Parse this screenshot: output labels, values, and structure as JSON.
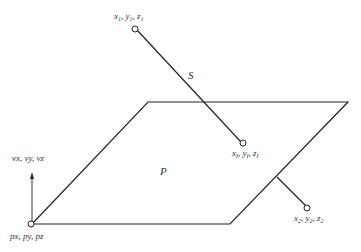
{
  "diagram": {
    "type": "ray-plane intersection geometry",
    "plane": {
      "label": "P"
    },
    "segment": {
      "label": "S"
    },
    "points": {
      "start": {
        "label": "x1, y1, z1"
      },
      "intersection": {
        "label": "xI, yI, zI"
      },
      "end": {
        "label": "x2, y2, z2"
      },
      "plane_point": {
        "label": "px, py, pz"
      },
      "plane_normal": {
        "label": "vx, vy, vz"
      }
    },
    "colors": {
      "line": "#222222",
      "background": "#ffffff"
    }
  }
}
